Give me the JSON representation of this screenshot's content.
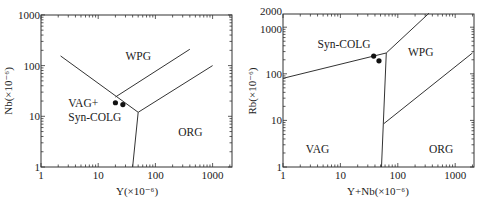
{
  "chart_data": [
    {
      "type": "scatter",
      "title": "",
      "xlabel": "Y(×10⁻⁶)",
      "ylabel": "Nb(×10⁻⁶)",
      "xscale": "log",
      "yscale": "log",
      "xlim": [
        1,
        2000
      ],
      "ylim": [
        1,
        1000
      ],
      "xticks": [
        "1",
        "10",
        "100",
        "1000"
      ],
      "yticks": [
        "1",
        "10",
        "100",
        "1000"
      ],
      "grid": false,
      "fields": [
        {
          "name": "WPG",
          "label": "WPG",
          "x": 30,
          "y": 130
        },
        {
          "name": "VAG+Syn-COLG",
          "label_lines": [
            "VAG+",
            "Syn-COLG"
          ],
          "x": 3,
          "y": 15
        },
        {
          "name": "ORG",
          "label": "ORG",
          "x": 250,
          "y": 4
        }
      ],
      "boundaries": [
        {
          "from": [
            2.2,
            155
          ],
          "to": [
            50,
            12
          ]
        },
        {
          "from": [
            50,
            12
          ],
          "to": [
            40,
            1
          ]
        },
        {
          "from": [
            50,
            12
          ],
          "to": [
            1000,
            100
          ]
        },
        {
          "from": [
            20,
            24
          ],
          "to": [
            400,
            210
          ]
        }
      ],
      "series": [
        {
          "name": "samples",
          "marker": "filled-circle",
          "points": [
            [
              20,
              18.5
            ],
            [
              27,
              17
            ]
          ]
        }
      ]
    },
    {
      "type": "scatter",
      "title": "",
      "xlabel": "Y+Nb(×10⁻⁶)",
      "ylabel": "Rb(×10⁻⁶)",
      "xscale": "log",
      "yscale": "log",
      "xlim": [
        1,
        2000
      ],
      "ylim": [
        1,
        2000
      ],
      "xticks": [
        "1",
        "10",
        "100",
        "1000"
      ],
      "yticks": [
        "1",
        "10",
        "100",
        "1000",
        "2000"
      ],
      "grid": false,
      "fields": [
        {
          "name": "Syn-COLG",
          "label": "Syn-COLG",
          "x": 4,
          "y": 350
        },
        {
          "name": "WPG",
          "label": "WPG",
          "x": 150,
          "y": 240
        },
        {
          "name": "VAG",
          "label": "VAG",
          "x": 2.5,
          "y": 2
        },
        {
          "name": "ORG",
          "label": "ORG",
          "x": 350,
          "y": 2
        }
      ],
      "boundaries": [
        {
          "from": [
            1,
            80
          ],
          "to": [
            63,
            280
          ]
        },
        {
          "from": [
            63,
            280
          ],
          "to": [
            52,
            1
          ]
        },
        {
          "from": [
            63,
            280
          ],
          "to": [
            350,
            2000
          ]
        },
        {
          "from": [
            57,
            8.5
          ],
          "to": [
            2000,
            280
          ]
        }
      ],
      "series": [
        {
          "name": "samples",
          "marker": "filled-circle",
          "points": [
            [
              38,
              240
            ],
            [
              47,
              190
            ]
          ]
        }
      ]
    }
  ]
}
